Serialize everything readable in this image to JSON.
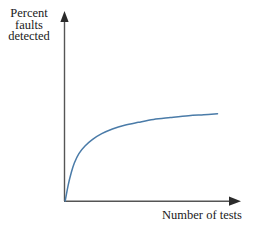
{
  "figure": {
    "background_color": "#ffffff",
    "axis_color": "#555555",
    "text_color": "#1a1a1a",
    "curve_color": "#4a7ba8"
  },
  "axes": {
    "y_label_lines": [
      "Percent",
      "faults",
      "detected"
    ],
    "y_label_text": "Percent faults detected",
    "x_label": "Number of tests",
    "y_axis_arrow": "arrow-up-icon",
    "x_axis_arrow": "arrow-right-icon"
  },
  "chart_data": {
    "type": "line",
    "title": "",
    "xlabel": "Number of tests",
    "ylabel": "Percent faults detected",
    "grid": false,
    "legend": null,
    "xlim": [
      0,
      100
    ],
    "ylim": [
      0,
      100
    ],
    "axis_ticks": {
      "x": [],
      "y": []
    },
    "series": [
      {
        "name": "Percent faults detected",
        "color": "#4a7ba8",
        "x": [
          0,
          2,
          4,
          6,
          9,
          13,
          18,
          24,
          31,
          39,
          48,
          58,
          69,
          81,
          91,
          100
        ],
        "y": [
          0,
          17,
          30,
          40,
          50,
          58,
          65,
          71,
          76,
          80,
          83,
          86,
          88,
          90,
          91,
          92
        ],
        "description": "Concave, monotonically increasing curve rising steeply from origin then saturating"
      }
    ]
  }
}
